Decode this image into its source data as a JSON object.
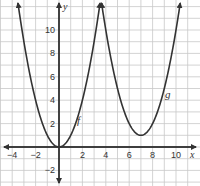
{
  "chart_data": {
    "type": "line",
    "title": "",
    "xlabel": "x",
    "ylabel": "y",
    "xlim": [
      -5,
      11.5
    ],
    "ylim": [
      -3.3,
      12.5
    ],
    "grid": true,
    "x_ticks": [
      -4,
      -2,
      2,
      4,
      6,
      8,
      10
    ],
    "y_ticks": [
      -2,
      2,
      4,
      6,
      8,
      10
    ],
    "series": [
      {
        "name": "f",
        "equation": "f(x) = x^2",
        "vertex": [
          0,
          0
        ],
        "x": [
          -3.5,
          -3,
          -2,
          -1,
          0,
          1,
          2,
          3,
          3.5
        ],
        "values": [
          12.25,
          9,
          4,
          1,
          0,
          1,
          4,
          9,
          12.25
        ]
      },
      {
        "name": "g",
        "equation": "g(x) = (x - 7)^2 + 1",
        "vertex": [
          7,
          1
        ],
        "x": [
          3.6,
          4,
          5,
          6,
          7,
          8,
          9,
          10,
          10.4
        ],
        "values": [
          12.56,
          10,
          5,
          2,
          1,
          2,
          5,
          10,
          12.56
        ]
      }
    ],
    "annotations": [
      {
        "text": "f",
        "near": [
          1.6,
          2
        ]
      },
      {
        "text": "g",
        "near": [
          9.3,
          4.5
        ]
      }
    ]
  },
  "labels": {
    "x_axis": "x",
    "y_axis": "y",
    "f": "f",
    "g": "g",
    "x_ticks": [
      "−4",
      "−2",
      "2",
      "4",
      "6",
      "8",
      "10"
    ],
    "y_ticks": [
      "10",
      "8",
      "6",
      "4",
      "2",
      "−2"
    ]
  },
  "colors": {
    "grid": "#c8c8c8",
    "axis": "#333333",
    "curve": "#333333",
    "background": "#ffffff"
  }
}
